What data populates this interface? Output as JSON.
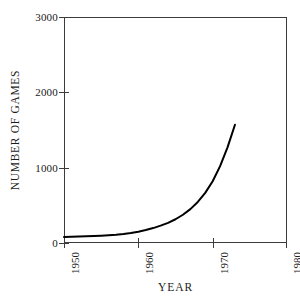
{
  "chart_data": {
    "type": "line",
    "title": "",
    "subtitle": "",
    "xlabel": "YEAR",
    "ylabel": "NUMBER OF GAMES",
    "xlim": [
      1950,
      1980
    ],
    "ylim": [
      0,
      3000
    ],
    "xticks": [
      1950,
      1960,
      1970,
      1980
    ],
    "xtick_labels": [
      "1950",
      "1960",
      "1970",
      "1980"
    ],
    "yticks": [
      0,
      1000,
      2000,
      3000
    ],
    "ytick_labels": [
      "0",
      "1000",
      "2000",
      "3000"
    ],
    "grid": false,
    "legend": null,
    "annotations": [],
    "series": [
      {
        "name": "Number of games",
        "color": "#000000",
        "x": [
          1950,
          1951,
          1952,
          1953,
          1954,
          1955,
          1956,
          1957,
          1958,
          1959,
          1960,
          1961,
          1962,
          1963,
          1964,
          1965,
          1966,
          1967,
          1968,
          1969,
          1970,
          1971,
          1972,
          1973
        ],
        "values": [
          80,
          82,
          85,
          88,
          92,
          97,
          103,
          110,
          120,
          133,
          150,
          172,
          198,
          230,
          268,
          315,
          375,
          450,
          545,
          665,
          820,
          1020,
          1270,
          1570
        ]
      }
    ]
  },
  "axes": {
    "y_ticks": [
      {
        "label": "3000",
        "value": 3000
      },
      {
        "label": "2000",
        "value": 2000
      },
      {
        "label": "1000",
        "value": 1000
      },
      {
        "label": "0",
        "value": 0
      }
    ],
    "x_ticks": [
      {
        "label": "1950",
        "value": 1950
      },
      {
        "label": "1960",
        "value": 1960
      },
      {
        "label": "1970",
        "value": 1970
      },
      {
        "label": "1980",
        "value": 1980
      }
    ],
    "y_title": "NUMBER OF GAMES",
    "x_title": "YEAR"
  },
  "style": {
    "axis_color": "#3c3c3c",
    "curve_color": "#000000",
    "text_color": "#1a1a1a",
    "background": "#ffffff"
  }
}
